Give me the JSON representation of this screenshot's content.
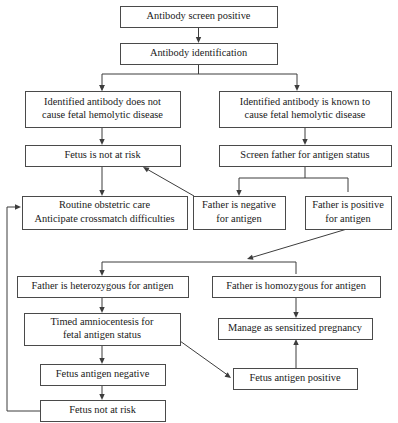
{
  "diagram": {
    "background_color": "#ffffff",
    "line_color": "#3d3d3d",
    "box_border_color": "#4a4a4a",
    "text_color": "#1a1a1a"
  },
  "nodes": [
    {
      "id": "antibody-screen-positive",
      "name": "antibody-screen-positive",
      "lines": [
        "Antibody screen positive"
      ],
      "x": 120,
      "y": 6,
      "w": 157,
      "h": 21
    },
    {
      "id": "antibody-identification",
      "name": "antibody-identification",
      "lines": [
        "Antibody identification"
      ],
      "x": 120,
      "y": 43,
      "w": 157,
      "h": 21
    },
    {
      "id": "antibody-not-cause-disease",
      "name": "antibody-does-not-cause-fetal-hemolytic-disease",
      "lines": [
        "Identified antibody does not",
        "cause fetal hemolytic disease"
      ],
      "x": 25,
      "y": 91,
      "w": 155,
      "h": 36
    },
    {
      "id": "antibody-known-cause-disease",
      "name": "antibody-known-to-cause-fetal-hemolytic-disease",
      "lines": [
        "Identified antibody is known to",
        "cause fetal hemolytic disease"
      ],
      "x": 219,
      "y": 91,
      "w": 172,
      "h": 36
    },
    {
      "id": "fetus-not-at-risk-top",
      "name": "fetus-is-not-at-risk",
      "lines": [
        "Fetus is not at risk"
      ],
      "x": 25,
      "y": 145,
      "w": 155,
      "h": 21
    },
    {
      "id": "screen-father-antigen",
      "name": "screen-father-for-antigen-status",
      "lines": [
        "Screen father for antigen status"
      ],
      "x": 219,
      "y": 145,
      "w": 172,
      "h": 21
    },
    {
      "id": "routine-obstetric-care",
      "name": "routine-obstetric-care",
      "lines": [
        "Routine obstetric care",
        "Anticipate crossmatch difficulties"
      ],
      "x": 22,
      "y": 196,
      "w": 165,
      "h": 33
    },
    {
      "id": "father-negative-antigen",
      "name": "father-is-negative-for-antigen",
      "lines": [
        "Father is negative",
        "for antigen"
      ],
      "x": 193,
      "y": 196,
      "w": 92,
      "h": 33
    },
    {
      "id": "father-positive-antigen",
      "name": "father-is-positive-for-antigen",
      "lines": [
        "Father is positive",
        "for antigen"
      ],
      "x": 305,
      "y": 196,
      "w": 86,
      "h": 33
    },
    {
      "id": "father-heterozygous",
      "name": "father-is-heterozygous-for-antigen",
      "lines": [
        "Father is heterozygous for antigen"
      ],
      "x": 17,
      "y": 276,
      "w": 171,
      "h": 21
    },
    {
      "id": "father-homozygous",
      "name": "father-is-homozygous-for-antigen",
      "lines": [
        "Father is homozygous for antigen"
      ],
      "x": 212,
      "y": 276,
      "w": 168,
      "h": 21
    },
    {
      "id": "timed-amniocentesis",
      "name": "timed-amniocentesis-for-fetal-antigen-status",
      "lines": [
        "Timed amniocentesis for",
        "fetal antigen status"
      ],
      "x": 24,
      "y": 313,
      "w": 156,
      "h": 32
    },
    {
      "id": "manage-sensitized-pregnancy",
      "name": "manage-as-sensitized-pregnancy",
      "lines": [
        "Manage as sensitized pregnancy"
      ],
      "x": 218,
      "y": 318,
      "w": 154,
      "h": 21
    },
    {
      "id": "fetus-antigen-negative",
      "name": "fetus-antigen-negative",
      "lines": [
        "Fetus antigen negative"
      ],
      "x": 40,
      "y": 364,
      "w": 125,
      "h": 21
    },
    {
      "id": "fetus-antigen-positive",
      "name": "fetus-antigen-positive",
      "lines": [
        "Fetus antigen positive"
      ],
      "x": 233,
      "y": 368,
      "w": 124,
      "h": 21
    },
    {
      "id": "fetus-not-at-risk-bottom",
      "name": "fetus-not-at-risk",
      "lines": [
        "Fetus not at risk"
      ],
      "x": 40,
      "y": 400,
      "w": 125,
      "h": 21
    }
  ],
  "edges": [
    {
      "name": "edge-screen-positive-to-identification",
      "from": "antibody-screen-positive",
      "to": "antibody-identification",
      "kind": "vertical-arrow",
      "path": "M198.5,27 L198.5,41",
      "arrow_at": [
        198.5,
        43
      ]
    },
    {
      "name": "edge-identification-split",
      "from": "antibody-identification",
      "to": "split-bar",
      "kind": "split",
      "path": "M198.5,64 L198.5,74 M102,74 L297,74 M102,74 L102,87 M297,74 L297,87",
      "arrow_at": [
        102,
        91
      ]
    },
    {
      "name": "edge-split-to-left-branch",
      "from": "split-bar",
      "to": "antibody-not-cause-disease",
      "kind": "vertical-arrow",
      "arrow_at": [
        102,
        91
      ]
    },
    {
      "name": "edge-split-to-right-branch",
      "from": "split-bar",
      "to": "antibody-known-cause-disease",
      "kind": "vertical-arrow",
      "arrow_at": [
        297,
        91
      ]
    },
    {
      "name": "edge-not-cause-to-fetus-not-at-risk",
      "from": "antibody-not-cause-disease",
      "to": "fetus-not-at-risk-top",
      "kind": "vertical-arrow",
      "path": "M102,127 L102,143",
      "arrow_at": [
        102,
        145
      ]
    },
    {
      "name": "edge-known-cause-to-screen-father",
      "from": "antibody-known-cause-disease",
      "to": "screen-father-antigen",
      "kind": "vertical-arrow",
      "path": "M305,127 L305,143",
      "arrow_at": [
        305,
        145
      ]
    },
    {
      "name": "edge-fetus-not-at-risk-to-routine-care",
      "from": "fetus-not-at-risk-top",
      "to": "routine-obstetric-care",
      "kind": "vertical-arrow",
      "path": "M102,166 L102,194",
      "arrow_at": [
        102,
        196
      ]
    },
    {
      "name": "edge-screen-father-split",
      "from": "screen-father-antigen",
      "to": "father-antigen-results",
      "kind": "split",
      "path": "M305,166 L305,178 M239,178 L348,178 M239,178 L239,192 M348,178 L348,192",
      "arrow_at": [
        239,
        196
      ]
    },
    {
      "name": "edge-father-negative-to-fetus-not-at-risk",
      "from": "father-negative-antigen",
      "to": "fetus-not-at-risk-top",
      "kind": "diagonal-arrow",
      "path": "M194,196 L145,168",
      "arrow_at": [
        143,
        167
      ]
    },
    {
      "name": "edge-father-positive-to-zygosity-split",
      "from": "father-positive-antigen",
      "to": "zygosity-split-bar",
      "kind": "diagonal-arrow",
      "path": "M347,229 L250,258",
      "arrow_at": [
        247,
        259
      ]
    },
    {
      "name": "edge-zygosity-split",
      "from": "zygosity-split-bar",
      "to": "father-zygosity",
      "kind": "split",
      "path": "M102,262 L296,262 M102,262 L102,274 M296,262 L296,274",
      "arrow_at": [
        102,
        276
      ]
    },
    {
      "name": "edge-heterozygous-to-amniocentesis",
      "from": "father-heterozygous",
      "to": "timed-amniocentesis",
      "kind": "vertical-arrow",
      "path": "M102,297 L102,311",
      "arrow_at": [
        102,
        313
      ]
    },
    {
      "name": "edge-homozygous-to-manage",
      "from": "father-homozygous",
      "to": "manage-sensitized-pregnancy",
      "kind": "vertical-arrow",
      "path": "M296,297 L296,316",
      "arrow_at": [
        296,
        318
      ]
    },
    {
      "name": "edge-amniocentesis-to-fetus-antigen-negative",
      "from": "timed-amniocentesis",
      "to": "fetus-antigen-negative",
      "kind": "vertical-arrow",
      "path": "M102,345 L102,362",
      "arrow_at": [
        102,
        364
      ]
    },
    {
      "name": "edge-amniocentesis-to-fetus-antigen-positive",
      "from": "timed-amniocentesis",
      "to": "fetus-antigen-positive",
      "kind": "diagonal-arrow",
      "path": "M180,341 L229,376",
      "arrow_at": [
        231,
        378
      ]
    },
    {
      "name": "edge-fetus-antigen-positive-to-manage",
      "from": "fetus-antigen-positive",
      "to": "manage-sensitized-pregnancy",
      "kind": "vertical-arrow-up",
      "path": "M296,368 L296,341",
      "arrow_at": [
        296,
        339
      ]
    },
    {
      "name": "edge-fetus-antigen-negative-to-not-at-risk",
      "from": "fetus-antigen-negative",
      "to": "fetus-not-at-risk-bottom",
      "kind": "vertical-arrow",
      "path": "M102,385 L102,398",
      "arrow_at": [
        102,
        400
      ]
    },
    {
      "name": "edge-fetus-not-at-risk-feedback-to-routine-care",
      "from": "fetus-not-at-risk-bottom",
      "to": "routine-obstetric-care",
      "kind": "feedback-loop",
      "path": "M40,411 L7,411 L7,207 L19,207",
      "arrow_at": [
        21,
        207
      ]
    }
  ]
}
